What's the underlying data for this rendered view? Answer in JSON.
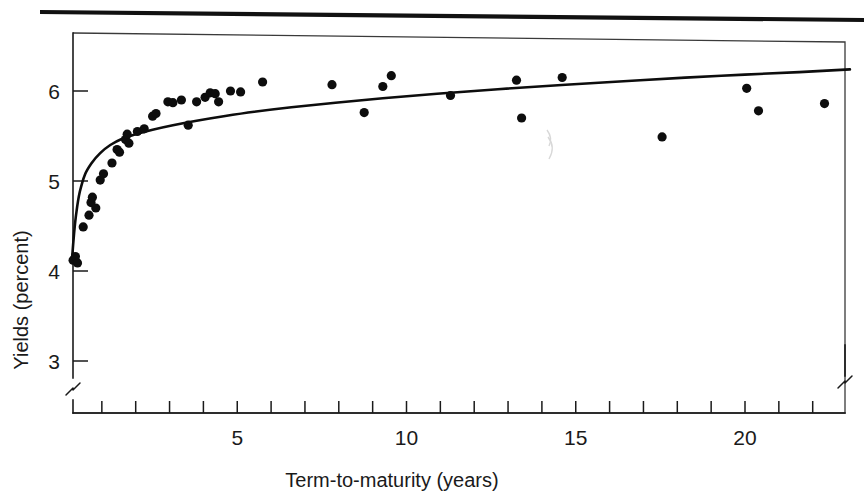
{
  "figure": {
    "name": "yield-curve-scatter",
    "background_color": "#ffffff",
    "ink_color": "#0d0d0d",
    "top_rule_visible": true
  },
  "chart_data": {
    "type": "scatter",
    "title": "",
    "subtitle": "",
    "xlabel": "Term-to-maturity (years)",
    "ylabel": "Yields (percent)",
    "xlim": [
      0,
      23.2
    ],
    "ylim": [
      2.55,
      6.75
    ],
    "grid": false,
    "legend": "none",
    "x_axis": {
      "tick_labels": [
        "5",
        "10",
        "15",
        "20"
      ],
      "labeled_ticks": [
        5,
        10,
        15,
        20
      ],
      "minor_tick_interval": 1,
      "minor_ticks": [
        1,
        2,
        3,
        4,
        5,
        6,
        7,
        8,
        9,
        10,
        11,
        12,
        13,
        14,
        15,
        16,
        17,
        18,
        19,
        20,
        21,
        22
      ],
      "axis_break": true,
      "break_position": "right-end"
    },
    "y_axis": {
      "tick_labels": [
        "3",
        "4",
        "5",
        "6"
      ],
      "labeled_ticks": [
        3,
        4,
        5,
        6
      ],
      "axis_break": true,
      "break_position": "below-3"
    },
    "series": [
      {
        "name": "Observed bond yields",
        "type": "scatter",
        "marker": "filled-circle",
        "color": "#0d0d0d",
        "points": [
          [
            0.15,
            4.12
          ],
          [
            0.22,
            4.16
          ],
          [
            0.28,
            4.09
          ],
          [
            0.45,
            4.49
          ],
          [
            0.62,
            4.62
          ],
          [
            0.68,
            4.76
          ],
          [
            0.72,
            4.82
          ],
          [
            0.82,
            4.7
          ],
          [
            0.95,
            5.01
          ],
          [
            1.05,
            5.08
          ],
          [
            1.3,
            5.2
          ],
          [
            1.45,
            5.35
          ],
          [
            1.52,
            5.32
          ],
          [
            1.7,
            5.46
          ],
          [
            1.75,
            5.52
          ],
          [
            1.8,
            5.42
          ],
          [
            2.05,
            5.55
          ],
          [
            2.25,
            5.58
          ],
          [
            2.5,
            5.72
          ],
          [
            2.6,
            5.75
          ],
          [
            2.95,
            5.88
          ],
          [
            3.1,
            5.87
          ],
          [
            3.35,
            5.9
          ],
          [
            3.55,
            5.62
          ],
          [
            3.8,
            5.88
          ],
          [
            4.05,
            5.93
          ],
          [
            4.2,
            5.98
          ],
          [
            4.35,
            5.97
          ],
          [
            4.45,
            5.88
          ],
          [
            4.8,
            6.0
          ],
          [
            5.1,
            5.99
          ],
          [
            5.75,
            6.1
          ],
          [
            7.8,
            6.07
          ],
          [
            8.75,
            5.76
          ],
          [
            9.3,
            6.05
          ],
          [
            9.55,
            6.17
          ],
          [
            11.3,
            5.95
          ],
          [
            13.25,
            6.12
          ],
          [
            13.4,
            5.7
          ],
          [
            14.6,
            6.15
          ],
          [
            17.55,
            5.49
          ],
          [
            20.05,
            6.03
          ],
          [
            20.4,
            5.78
          ],
          [
            22.35,
            5.86
          ]
        ]
      },
      {
        "name": "Fitted yield curve",
        "type": "line",
        "color": "#0d0d0d",
        "points": [
          [
            0.12,
            4.14
          ],
          [
            0.18,
            4.42
          ],
          [
            0.25,
            4.66
          ],
          [
            0.35,
            4.88
          ],
          [
            0.5,
            5.07
          ],
          [
            0.7,
            5.2
          ],
          [
            0.95,
            5.31
          ],
          [
            1.25,
            5.4
          ],
          [
            1.6,
            5.47
          ],
          [
            2.0,
            5.52
          ],
          [
            2.5,
            5.57
          ],
          [
            3.1,
            5.62
          ],
          [
            3.8,
            5.67
          ],
          [
            4.6,
            5.72
          ],
          [
            5.5,
            5.77
          ],
          [
            6.6,
            5.82
          ],
          [
            7.9,
            5.87
          ],
          [
            9.3,
            5.92
          ],
          [
            10.9,
            5.97
          ],
          [
            12.7,
            6.02
          ],
          [
            14.7,
            6.07
          ],
          [
            16.9,
            6.12
          ],
          [
            19.3,
            6.17
          ],
          [
            21.6,
            6.21
          ],
          [
            23.1,
            6.24
          ]
        ]
      }
    ]
  }
}
